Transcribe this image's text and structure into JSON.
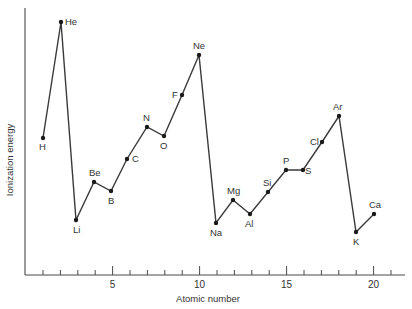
{
  "chart_data": {
    "type": "line",
    "title": "",
    "xlabel": "Atomic number",
    "ylabel": "Ionization energy",
    "x_ticks_labeled": [
      5,
      10,
      15,
      20
    ],
    "x_ticks_minor": [
      1,
      2,
      3,
      4,
      5,
      6,
      7,
      8,
      9,
      10,
      11,
      12,
      13,
      14,
      15,
      16,
      17,
      18,
      19,
      20,
      21
    ],
    "xlim": [
      0,
      22
    ],
    "grid": false,
    "legend": null,
    "y_tick_labels": false,
    "points": [
      {
        "z": 1,
        "symbol": "H",
        "px": 43,
        "py": 138,
        "lx": -4,
        "ly": 12
      },
      {
        "z": 2,
        "symbol": "He",
        "px": 61,
        "py": 22,
        "lx": 4,
        "ly": 3
      },
      {
        "z": 3,
        "symbol": "Li",
        "px": 76,
        "py": 220,
        "lx": -3,
        "ly": 13
      },
      {
        "z": 4,
        "symbol": "Be",
        "px": 94,
        "py": 182,
        "lx": -5,
        "ly": -6
      },
      {
        "z": 5,
        "symbol": "B",
        "px": 111,
        "py": 191,
        "lx": -3,
        "ly": 13
      },
      {
        "z": 6,
        "symbol": "C",
        "px": 127,
        "py": 159,
        "lx": 5,
        "ly": 3
      },
      {
        "z": 7,
        "symbol": "N",
        "px": 147,
        "py": 127,
        "lx": -4,
        "ly": -6
      },
      {
        "z": 8,
        "symbol": "O",
        "px": 164,
        "py": 136,
        "lx": -4,
        "ly": 13
      },
      {
        "z": 9,
        "symbol": "F",
        "px": 182,
        "py": 95,
        "lx": -10,
        "ly": 3
      },
      {
        "z": 10,
        "symbol": "Ne",
        "px": 199,
        "py": 55,
        "lx": -6,
        "ly": -6
      },
      {
        "z": 11,
        "symbol": "Na",
        "px": 216,
        "py": 223,
        "lx": -6,
        "ly": 13
      },
      {
        "z": 12,
        "symbol": "Mg",
        "px": 233,
        "py": 200,
        "lx": -6,
        "ly": -6
      },
      {
        "z": 13,
        "symbol": "Al",
        "px": 250,
        "py": 214,
        "lx": -5,
        "ly": 13
      },
      {
        "z": 14,
        "symbol": "Si",
        "px": 268,
        "py": 192,
        "lx": -5,
        "ly": -6
      },
      {
        "z": 15,
        "symbol": "P",
        "px": 286,
        "py": 170,
        "lx": -3,
        "ly": -6
      },
      {
        "z": 16,
        "symbol": "S",
        "px": 303,
        "py": 170,
        "lx": 2,
        "ly": 4
      },
      {
        "z": 17,
        "symbol": "Cl",
        "px": 322,
        "py": 142,
        "lx": -12,
        "ly": 3
      },
      {
        "z": 18,
        "symbol": "Ar",
        "px": 339,
        "py": 116,
        "lx": -6,
        "ly": -6
      },
      {
        "z": 19,
        "symbol": "K",
        "px": 356,
        "py": 232,
        "lx": -3,
        "ly": 13
      },
      {
        "z": 20,
        "symbol": "Ca",
        "px": 374,
        "py": 214,
        "lx": -5,
        "ly": -6
      }
    ],
    "series": [
      {
        "name": "First ionization energy (eV)",
        "x": [
          1,
          2,
          3,
          4,
          5,
          6,
          7,
          8,
          9,
          10,
          11,
          12,
          13,
          14,
          15,
          16,
          17,
          18,
          19,
          20
        ],
        "labels": [
          "H",
          "He",
          "Li",
          "Be",
          "B",
          "C",
          "N",
          "O",
          "F",
          "Ne",
          "Na",
          "Mg",
          "Al",
          "Si",
          "P",
          "S",
          "Cl",
          "Ar",
          "K",
          "Ca"
        ],
        "values": [
          13.6,
          24.6,
          5.4,
          9.3,
          8.3,
          11.3,
          14.5,
          13.6,
          17.4,
          21.6,
          5.1,
          7.6,
          6.0,
          8.2,
          10.5,
          10.4,
          13.0,
          15.8,
          4.3,
          6.1
        ]
      }
    ]
  },
  "axes": {
    "x_label": "Atomic number",
    "y_label": "Ionization energy",
    "tick_labels": [
      "5",
      "10",
      "15",
      "20"
    ]
  }
}
